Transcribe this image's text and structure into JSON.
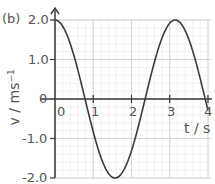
{
  "panel_label": "(b)",
  "chart_data": {
    "type": "line",
    "title": "",
    "xlabel": "t / s",
    "ylabel": "v / ms⁻¹",
    "xlim": [
      0,
      4
    ],
    "ylim": [
      -2.0,
      2.0
    ],
    "x_ticks": [
      "0",
      "1",
      "2",
      "3",
      "4"
    ],
    "y_ticks": [
      "2.0",
      "1.0",
      "0",
      "-1.0",
      "-2.0"
    ],
    "grid": true,
    "legend": null,
    "series": [
      {
        "name": "v",
        "function": "v = 2.0 cos(2t)",
        "x": [
          0,
          0.25,
          0.5,
          0.785,
          1.0,
          1.25,
          1.5,
          1.571,
          1.75,
          2.0,
          2.25,
          2.356,
          2.5,
          2.75,
          3.0,
          3.142,
          3.25,
          3.5,
          3.75,
          3.927,
          4.0
        ],
        "values": [
          2.0,
          1.76,
          1.08,
          0.0,
          -0.83,
          -1.6,
          -1.98,
          -2.0,
          -1.87,
          -1.31,
          -0.42,
          0.0,
          0.57,
          1.41,
          1.92,
          2.0,
          1.95,
          1.51,
          0.69,
          0.0,
          -0.29
        ]
      }
    ]
  },
  "axis_text": {
    "x_label_t": "t",
    "x_label_unit": "/ s",
    "y_label": "v / ms",
    "y_label_sup": "−1"
  },
  "colors": {
    "curve": "#3a3a3a",
    "axis": "#3a3a3a",
    "grid_major": "#d4d4d4",
    "grid_minor": "#ececec",
    "text": "#555555"
  }
}
